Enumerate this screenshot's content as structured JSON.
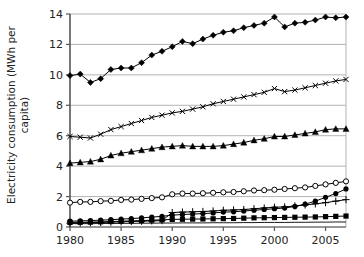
{
  "chart_data": {
    "type": "line",
    "title": "",
    "xlabel": "",
    "ylabel_line1": "Electricity consumption (MWh per",
    "ylabel_line2": "capita)",
    "ylabel": "Electricity consumption (MWh per capita)",
    "grid": true,
    "legend": "none",
    "xlim": [
      1980,
      2007
    ],
    "ylim": [
      0,
      14
    ],
    "yticks": [
      0,
      2,
      4,
      6,
      8,
      10,
      12,
      14
    ],
    "ytick_labels": [
      "0",
      "2",
      "4",
      "6",
      "8",
      "10",
      "12",
      "14"
    ],
    "xticks": [
      1980,
      1985,
      1990,
      1995,
      2000,
      2005
    ],
    "xtick_labels": [
      "1980",
      "1985",
      "1990",
      "1995",
      "2000",
      "2005"
    ],
    "x": [
      1980,
      1981,
      1982,
      1983,
      1984,
      1985,
      1986,
      1987,
      1988,
      1989,
      1990,
      1991,
      1992,
      1993,
      1994,
      1995,
      1996,
      1997,
      1998,
      1999,
      2000,
      2001,
      2002,
      2003,
      2004,
      2005,
      2006,
      2007
    ],
    "series": [
      {
        "name": "series-diamond",
        "marker": "filled-diamond",
        "color": "#000000",
        "values": [
          9.95,
          10.05,
          9.5,
          9.75,
          10.35,
          10.45,
          10.45,
          10.8,
          11.3,
          11.55,
          11.85,
          12.2,
          12.05,
          12.35,
          12.6,
          12.8,
          12.9,
          13.1,
          13.25,
          13.4,
          13.8,
          13.15,
          13.4,
          13.45,
          13.6,
          13.8,
          13.75,
          13.8
        ]
      },
      {
        "name": "series-cross",
        "marker": "x-cross",
        "color": "#000000",
        "values": [
          5.95,
          5.9,
          5.85,
          6.1,
          6.4,
          6.6,
          6.8,
          7.0,
          7.2,
          7.35,
          7.5,
          7.6,
          7.75,
          7.9,
          8.1,
          8.25,
          8.4,
          8.55,
          8.7,
          8.85,
          9.1,
          8.9,
          9.0,
          9.15,
          9.3,
          9.45,
          9.6,
          9.7
        ]
      },
      {
        "name": "series-triangle",
        "marker": "filled-triangle",
        "color": "#000000",
        "values": [
          4.2,
          4.25,
          4.3,
          4.45,
          4.7,
          4.85,
          4.95,
          5.05,
          5.15,
          5.25,
          5.3,
          5.35,
          5.3,
          5.3,
          5.3,
          5.35,
          5.45,
          5.55,
          5.7,
          5.8,
          5.95,
          5.95,
          6.05,
          6.15,
          6.25,
          6.4,
          6.45,
          6.45
        ]
      },
      {
        "name": "series-open-circle",
        "marker": "open-circle",
        "color": "#000000",
        "values": [
          1.6,
          1.65,
          1.65,
          1.7,
          1.72,
          1.78,
          1.8,
          1.85,
          1.9,
          1.95,
          2.15,
          2.2,
          2.2,
          2.22,
          2.25,
          2.28,
          2.3,
          2.35,
          2.4,
          2.42,
          2.45,
          2.5,
          2.55,
          2.6,
          2.7,
          2.8,
          2.9,
          3.0
        ]
      },
      {
        "name": "series-filled-circle",
        "marker": "filled-circle",
        "color": "#000000",
        "values": [
          0.38,
          0.4,
          0.42,
          0.45,
          0.48,
          0.52,
          0.55,
          0.6,
          0.65,
          0.7,
          0.78,
          0.82,
          0.85,
          0.88,
          0.92,
          0.98,
          1.0,
          1.05,
          1.1,
          1.15,
          1.2,
          1.25,
          1.35,
          1.5,
          1.7,
          1.95,
          2.2,
          2.5
        ]
      },
      {
        "name": "series-plus",
        "marker": "plus",
        "color": "#000000",
        "values": [
          0.25,
          0.26,
          0.28,
          0.3,
          0.32,
          0.34,
          0.36,
          0.38,
          0.4,
          0.42,
          0.95,
          0.98,
          1.0,
          1.02,
          1.05,
          1.1,
          1.12,
          1.15,
          1.2,
          1.25,
          1.3,
          1.32,
          1.38,
          1.45,
          1.52,
          1.6,
          1.7,
          1.8
        ]
      },
      {
        "name": "series-filled-square",
        "marker": "filled-square",
        "color": "#000000",
        "values": [
          0.3,
          0.31,
          0.32,
          0.34,
          0.36,
          0.38,
          0.4,
          0.42,
          0.45,
          0.47,
          0.5,
          0.51,
          0.52,
          0.53,
          0.54,
          0.55,
          0.56,
          0.58,
          0.6,
          0.61,
          0.62,
          0.63,
          0.64,
          0.65,
          0.66,
          0.68,
          0.7,
          0.72
        ]
      },
      {
        "name": "series-thin-flat",
        "marker": "none",
        "color": "#000000",
        "values": [
          0.22,
          0.22,
          0.22,
          0.23,
          0.23,
          0.24,
          0.24,
          0.25,
          0.25,
          0.26,
          0.26,
          0.27,
          0.27,
          0.27,
          0.28,
          0.28,
          0.28,
          0.29,
          0.29,
          0.3,
          0.3,
          0.3,
          0.31,
          0.31,
          0.32,
          0.32,
          0.33,
          0.33
        ]
      }
    ]
  },
  "style": {
    "grid_color": "#b3b3b3",
    "axis_color": "#555555",
    "text_color": "#222222",
    "plot_bg": "#ffffff"
  }
}
